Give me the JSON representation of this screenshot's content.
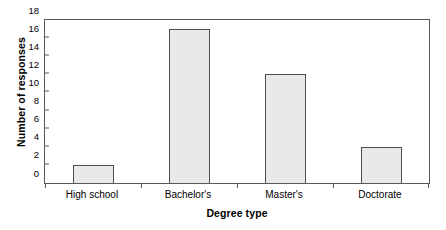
{
  "chart_data": {
    "type": "bar",
    "title": "",
    "categories": [
      "High school",
      "Bachelor's",
      "Master's",
      "Doctorate"
    ],
    "values": [
      2,
      17,
      12,
      4
    ],
    "xlabel": "Degree type",
    "ylabel": "Number of responses",
    "ylim": [
      0,
      18
    ],
    "ytick_step": 2,
    "yticks": [
      0,
      2,
      4,
      6,
      8,
      10,
      12,
      14,
      16,
      18
    ],
    "ytick_labels": [
      "0",
      "2",
      "4",
      "6",
      "8",
      "10",
      "12",
      "14",
      "16",
      "18"
    ],
    "grid": false,
    "legend": null,
    "bar_fill_color": "#e9e9e9",
    "bar_edge_color": "#4d4d4f",
    "frame_color": "#58585a",
    "background_color": "#ffffff"
  }
}
